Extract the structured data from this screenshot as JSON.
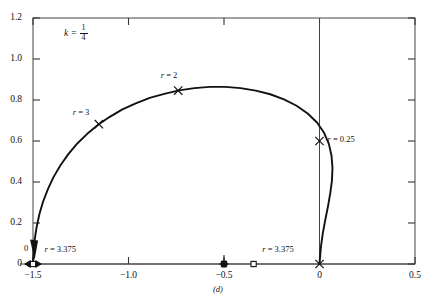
{
  "figure": {
    "caption": "(d)",
    "annotation": {
      "symbol": "k",
      "equals": "=",
      "numerator": "1",
      "denominator": "4"
    }
  },
  "chart_data": {
    "type": "line",
    "title": "",
    "xlabel": "",
    "ylabel": "",
    "xlim": [
      -1.5,
      0.5
    ],
    "ylim": [
      0,
      1.2
    ],
    "grid": false,
    "legend": "none",
    "xticks": [
      -1.5,
      -1.0,
      -0.5,
      0,
      0.5
    ],
    "xticklabels": [
      "−1.5",
      "−1.0",
      "−0.5",
      "0",
      "0.5"
    ],
    "yticks": [
      0,
      0.2,
      0.4,
      0.6,
      0.8,
      1.0,
      1.2
    ],
    "yticklabels": [
      "0",
      "0.2",
      "0.4",
      "0.6",
      "0.8",
      "1.0",
      "1.2"
    ],
    "parameter_label": "k = 1/4",
    "series": [
      {
        "name": "root-locus-branch",
        "points": [
          [
            -1.5,
            0.0
          ],
          [
            -1.497,
            0.06
          ],
          [
            -1.491,
            0.12
          ],
          [
            -1.481,
            0.18
          ],
          [
            -1.466,
            0.245
          ],
          [
            -1.447,
            0.305
          ],
          [
            -1.422,
            0.365
          ],
          [
            -1.392,
            0.425
          ],
          [
            -1.356,
            0.482
          ],
          [
            -1.315,
            0.536
          ],
          [
            -1.268,
            0.588
          ],
          [
            -1.216,
            0.635
          ],
          [
            -1.159,
            0.679
          ],
          [
            -1.098,
            0.718
          ],
          [
            -1.032,
            0.754
          ],
          [
            -0.962,
            0.784
          ],
          [
            -0.889,
            0.81
          ],
          [
            -0.813,
            0.83
          ],
          [
            -0.735,
            0.847
          ],
          [
            -0.655,
            0.858
          ],
          [
            -0.574,
            0.864
          ],
          [
            -0.493,
            0.864
          ],
          [
            -0.413,
            0.858
          ],
          [
            -0.334,
            0.846
          ],
          [
            -0.258,
            0.828
          ],
          [
            -0.186,
            0.803
          ],
          [
            -0.12,
            0.772
          ],
          [
            -0.062,
            0.734
          ],
          [
            -0.013,
            0.69
          ],
          [
            0.024,
            0.64
          ],
          [
            0.049,
            0.586
          ],
          [
            0.063,
            0.528
          ],
          [
            0.068,
            0.468
          ],
          [
            0.065,
            0.406
          ],
          [
            0.056,
            0.343
          ],
          [
            0.044,
            0.279
          ],
          [
            0.03,
            0.214
          ],
          [
            0.017,
            0.148
          ],
          [
            0.007,
            0.08
          ],
          [
            0.0,
            0.0
          ]
        ]
      }
    ],
    "markers": [
      {
        "name": "r3",
        "label": "r = 3",
        "r_value": "3",
        "x": -1.155,
        "y": 0.682,
        "shape": "x"
      },
      {
        "name": "r2",
        "label": "r = 2",
        "r_value": "2",
        "x": -0.74,
        "y": 0.846,
        "shape": "x"
      },
      {
        "name": "r025",
        "label": "r = 0.25",
        "r_value": "0.25",
        "x": 0.0,
        "y": 0.6,
        "shape": "x"
      },
      {
        "name": "origin",
        "label": "",
        "r_value": "",
        "x": 0.0,
        "y": 0.0,
        "shape": "x"
      },
      {
        "name": "r3375a",
        "label": "r = 3.375",
        "r_value": "3.375",
        "x": -1.5,
        "y": 0.0,
        "shape": "square"
      },
      {
        "name": "r3375b",
        "label": "r = 3.375",
        "r_value": "3.375",
        "x": -0.5,
        "y": 0.0,
        "shape": "square"
      },
      {
        "name": "r3375c",
        "label": "",
        "r_value": "",
        "x": -0.345,
        "y": 0.0,
        "shape": "square"
      }
    ],
    "annotations": [
      {
        "name": "zero-marker-label",
        "text": "0",
        "x": -1.5,
        "y": 0.035
      },
      {
        "name": "r3375-left-label",
        "text": "r = 3.375",
        "x": -1.44,
        "y": 0.045
      },
      {
        "name": "r3375-mid-label",
        "text": "r = 3.375",
        "x": -0.3,
        "y": 0.045
      }
    ]
  }
}
